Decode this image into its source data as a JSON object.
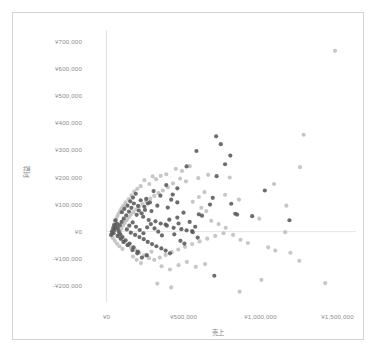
{
  "chart_data": {
    "type": "scatter",
    "title": "",
    "xlabel": "売上",
    "ylabel": "利益",
    "xlim": [
      -120000,
      1620000
    ],
    "ylim": [
      -260000,
      745000
    ],
    "grid": false,
    "legend": "none",
    "x_ticks": [
      "¥0",
      "¥500,000",
      "¥1,000,000",
      "¥1,500,000"
    ],
    "x_tick_values": [
      0,
      500000,
      1000000,
      1500000
    ],
    "y_ticks": [
      "¥700,000",
      "¥600,000",
      "¥500,000",
      "¥400,000",
      "¥300,000",
      "¥200,000",
      "¥100,000",
      "¥0",
      "-¥100,000",
      "-¥200,000"
    ],
    "y_tick_values": [
      700000,
      600000,
      500000,
      400000,
      300000,
      200000,
      100000,
      0,
      -100000,
      -200000
    ],
    "colors": {
      "series_dark": "#595959",
      "series_light": "#bfbfbf",
      "axis_line": "#d9d9d9",
      "tick_text": "#8c8c8c",
      "frame": "#d4d4d4"
    },
    "marker": {
      "shape": "circle",
      "size_px": 4.2
    },
    "series": [
      {
        "name": "dark",
        "color": "#595959",
        "points": [
          [
            712000,
            352000
          ],
          [
            584000,
            298000
          ],
          [
            804000,
            281000
          ],
          [
            742000,
            323000
          ],
          [
            770000,
            249000
          ],
          [
            715000,
            205000
          ],
          [
            520000,
            241000
          ],
          [
            1028000,
            152000
          ],
          [
            1188000,
            42000
          ],
          [
            946000,
            57000
          ],
          [
            810000,
            103000
          ],
          [
            690000,
            125000
          ],
          [
            836000,
            66000
          ],
          [
            848000,
            63000
          ],
          [
            672000,
            100000
          ],
          [
            700000,
            -163000
          ],
          [
            460000,
            160000
          ],
          [
            388000,
            172000
          ],
          [
            306000,
            150000
          ],
          [
            430000,
            137000
          ],
          [
            350000,
            133000
          ],
          [
            258000,
            121000
          ],
          [
            282000,
            108000
          ],
          [
            330000,
            96000
          ],
          [
            398000,
            89000
          ],
          [
            250000,
            80000
          ],
          [
            205000,
            95000
          ],
          [
            222000,
            116000
          ],
          [
            178000,
            104000
          ],
          [
            162000,
            88000
          ],
          [
            146000,
            74000
          ],
          [
            196000,
            62000
          ],
          [
            238000,
            55000
          ],
          [
            274000,
            43000
          ],
          [
            318000,
            38000
          ],
          [
            352000,
            30000
          ],
          [
            392000,
            22000
          ],
          [
            436000,
            14000
          ],
          [
            486000,
            9000
          ],
          [
            520000,
            5000
          ],
          [
            556000,
            2000
          ],
          [
            600000,
            64000
          ],
          [
            620000,
            59000
          ],
          [
            128000,
            60000
          ],
          [
            112000,
            48000
          ],
          [
            98000,
            36000
          ],
          [
            86000,
            24000
          ],
          [
            74000,
            12000
          ],
          [
            132000,
            8000
          ],
          [
            158000,
            -4000
          ],
          [
            186000,
            -12000
          ],
          [
            214000,
            -20000
          ],
          [
            242000,
            -28000
          ],
          [
            268000,
            -38000
          ],
          [
            296000,
            -46000
          ],
          [
            324000,
            -54000
          ],
          [
            356000,
            -62000
          ],
          [
            384000,
            -70000
          ],
          [
            412000,
            -80000
          ],
          [
            262000,
            -88000
          ],
          [
            230000,
            -96000
          ],
          [
            204000,
            -74000
          ],
          [
            176000,
            -58000
          ],
          [
            150000,
            -44000
          ],
          [
            124000,
            -32000
          ],
          [
            104000,
            -20000
          ],
          [
            90000,
            -10000
          ],
          [
            80000,
            0
          ],
          [
            148000,
            22000
          ],
          [
            170000,
            34000
          ],
          [
            192000,
            18000
          ],
          [
            216000,
            6000
          ],
          [
            240000,
            -6000
          ],
          [
            264000,
            16000
          ],
          [
            288000,
            28000
          ],
          [
            312000,
            12000
          ],
          [
            336000,
            0
          ],
          [
            360000,
            -14000
          ],
          [
            384000,
            26000
          ],
          [
            408000,
            44000
          ],
          [
            460000,
            52000
          ],
          [
            480000,
            -34000
          ],
          [
            506000,
            -44000
          ],
          [
            540000,
            36000
          ],
          [
            560000,
            -2000
          ],
          [
            576000,
            18000
          ],
          [
            592000,
            -22000
          ],
          [
            460000,
            108000
          ],
          [
            420000,
            118000
          ],
          [
            500000,
            70000
          ],
          [
            468000,
            30000
          ],
          [
            440000,
            -10000
          ],
          [
            100000,
            72000
          ],
          [
            116000,
            84000
          ],
          [
            136000,
            96000
          ],
          [
            154000,
            112000
          ],
          [
            172000,
            126000
          ],
          [
            190000,
            140000
          ],
          [
            210000,
            78000
          ],
          [
            228000,
            68000
          ],
          [
            246000,
            92000
          ],
          [
            268000,
            104000
          ],
          [
            292000,
            76000
          ],
          [
            62000,
            18000
          ],
          [
            54000,
            6000
          ],
          [
            46000,
            -6000
          ],
          [
            68000,
            30000
          ],
          [
            58000,
            42000
          ],
          [
            44000,
            12000
          ],
          [
            36000,
            0
          ],
          [
            30000,
            -12000
          ],
          [
            50000,
            24000
          ],
          [
            72000,
            -16000
          ],
          [
            92000,
            -26000
          ],
          [
            110000,
            -38000
          ],
          [
            138000,
            -50000
          ],
          [
            168000,
            -68000
          ],
          [
            200000,
            -80000
          ]
        ]
      },
      {
        "name": "light",
        "color": "#bfbfbf",
        "points": [
          [
            1484000,
            668000
          ],
          [
            1280000,
            358000
          ],
          [
            1256000,
            238000
          ],
          [
            1088000,
            176000
          ],
          [
            1168000,
            96000
          ],
          [
            992000,
            48000
          ],
          [
            1194000,
            -78000
          ],
          [
            1252000,
            -108000
          ],
          [
            1420000,
            -190000
          ],
          [
            1050000,
            -58000
          ],
          [
            1096000,
            -70000
          ],
          [
            1006000,
            -178000
          ],
          [
            1160000,
            -2000
          ],
          [
            918000,
            -42000
          ],
          [
            870000,
            -30000
          ],
          [
            660000,
            210000
          ],
          [
            596000,
            198000
          ],
          [
            516000,
            186000
          ],
          [
            478000,
            196000
          ],
          [
            432000,
            178000
          ],
          [
            398000,
            164000
          ],
          [
            366000,
            152000
          ],
          [
            338000,
            142000
          ],
          [
            310000,
            132000
          ],
          [
            284000,
            122000
          ],
          [
            258000,
            112000
          ],
          [
            234000,
            102000
          ],
          [
            212000,
            92000
          ],
          [
            192000,
            82000
          ],
          [
            174000,
            72000
          ],
          [
            158000,
            62000
          ],
          [
            144000,
            52000
          ],
          [
            130000,
            42000
          ],
          [
            118000,
            32000
          ],
          [
            106000,
            22000
          ],
          [
            96000,
            12000
          ],
          [
            88000,
            2000
          ],
          [
            82000,
            -8000
          ],
          [
            78000,
            -18000
          ],
          [
            96000,
            -28000
          ],
          [
            114000,
            -38000
          ],
          [
            136000,
            -48000
          ],
          [
            160000,
            -58000
          ],
          [
            186000,
            -68000
          ],
          [
            214000,
            -78000
          ],
          [
            244000,
            -88000
          ],
          [
            276000,
            -98000
          ],
          [
            310000,
            -104000
          ],
          [
            346000,
            -96000
          ],
          [
            384000,
            -86000
          ],
          [
            424000,
            -76000
          ],
          [
            466000,
            -66000
          ],
          [
            510000,
            -56000
          ],
          [
            556000,
            -46000
          ],
          [
            604000,
            -36000
          ],
          [
            654000,
            -26000
          ],
          [
            706000,
            -16000
          ],
          [
            760000,
            -6000
          ],
          [
            330000,
            -192000
          ],
          [
            420000,
            -206000
          ],
          [
            864000,
            -222000
          ],
          [
            640000,
            -120000
          ],
          [
            580000,
            -130000
          ],
          [
            522000,
            -112000
          ],
          [
            468000,
            -124000
          ],
          [
            412000,
            -140000
          ],
          [
            358000,
            -128000
          ],
          [
            246000,
            190000
          ],
          [
            278000,
            176000
          ],
          [
            300000,
            204000
          ],
          [
            322000,
            194000
          ],
          [
            352000,
            206000
          ],
          [
            388000,
            212000
          ],
          [
            144000,
            120000
          ],
          [
            162000,
            134000
          ],
          [
            180000,
            148000
          ],
          [
            200000,
            158000
          ],
          [
            222000,
            168000
          ],
          [
            124000,
            108000
          ],
          [
            110000,
            96000
          ],
          [
            98000,
            86000
          ],
          [
            88000,
            76000
          ],
          [
            78000,
            66000
          ],
          [
            70000,
            56000
          ],
          [
            62000,
            46000
          ],
          [
            56000,
            36000
          ],
          [
            50000,
            26000
          ],
          [
            44000,
            16000
          ],
          [
            40000,
            6000
          ],
          [
            36000,
            -4000
          ],
          [
            34000,
            -14000
          ],
          [
            42000,
            -24000
          ],
          [
            54000,
            -34000
          ],
          [
            68000,
            -44000
          ],
          [
            84000,
            -54000
          ],
          [
            104000,
            -64000
          ],
          [
            540000,
            242000
          ],
          [
            490000,
            224000
          ],
          [
            450000,
            232000
          ],
          [
            616000,
            88000
          ],
          [
            648000,
            76000
          ],
          [
            680000,
            40000
          ],
          [
            728000,
            28000
          ],
          [
            774000,
            14000
          ],
          [
            822000,
            -12000
          ],
          [
            560000,
            110000
          ],
          [
            600000,
            128000
          ],
          [
            636000,
            146000
          ],
          [
            172000,
            -92000
          ],
          [
            196000,
            -104000
          ],
          [
            224000,
            -116000
          ],
          [
            258000,
            -86000
          ],
          [
            292000,
            -74000
          ],
          [
            800000,
            200000
          ],
          [
            770000,
            136000
          ],
          [
            860000,
            118000
          ]
        ]
      }
    ]
  },
  "frame": {
    "border_color": "#d4d4d4"
  }
}
